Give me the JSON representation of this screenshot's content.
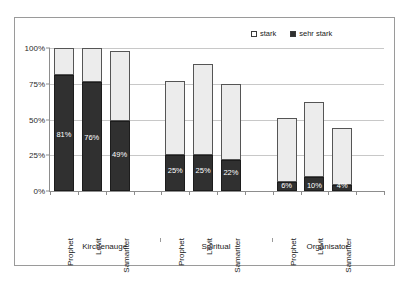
{
  "chart_data": {
    "type": "bar",
    "title": "",
    "subtitle": "",
    "xlabel": "",
    "ylabel": "",
    "ylim": [
      0,
      100
    ],
    "ytick_labels": [
      "0%",
      "25%",
      "50%",
      "75%",
      "100%"
    ],
    "ytick_values": [
      0,
      25,
      50,
      75,
      100
    ],
    "grid": true,
    "stacked": true,
    "legend_position": "top-right",
    "legend": [
      "stark",
      "sehr stark"
    ],
    "groups": [
      "Kirchenauge",
      "Spiritual",
      "Organisator"
    ],
    "categories": [
      "Prophet",
      "Levit",
      "Samariter",
      "Prophet",
      "Levit",
      "Samariter",
      "Prophet",
      "Levit",
      "Samariter"
    ],
    "series": [
      {
        "name": "sehr stark",
        "color": "#303030",
        "values": [
          81,
          76,
          49,
          25,
          25,
          22,
          6,
          10,
          4
        ],
        "labels": [
          "81%",
          "76%",
          "49%",
          "25%",
          "25%",
          "22%",
          "6%",
          "10%",
          "4%"
        ]
      },
      {
        "name": "stark",
        "color": "#ececec",
        "values": [
          19,
          24,
          49,
          52,
          64,
          53,
          45,
          52,
          40
        ],
        "labels": [
          "",
          "",
          "",
          "",
          "",
          "",
          "",
          "",
          ""
        ]
      }
    ],
    "totals": [
      100,
      100,
      98,
      77,
      89,
      75,
      51,
      62,
      44
    ],
    "colors": {
      "stark": "#ececec",
      "sehr_stark": "#303030",
      "grid": "#c8c8c8",
      "axis": "#8d8d8d",
      "border": "#9a9a9a",
      "value_label": "#ffffff"
    }
  }
}
